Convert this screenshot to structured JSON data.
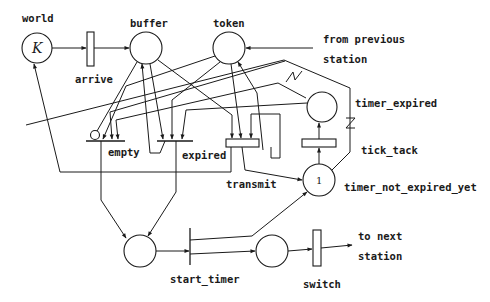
{
  "diagram": {
    "type": "petri-net",
    "places": [
      {
        "id": "world",
        "label": "world",
        "marking": "K"
      },
      {
        "id": "buffer",
        "label": "buffer",
        "marking": ""
      },
      {
        "id": "token",
        "label": "token",
        "marking": ""
      },
      {
        "id": "timer_expired",
        "label": "timer_expired",
        "marking": ""
      },
      {
        "id": "timer_not_expired_yet",
        "label": "timer_not_expired_yet",
        "marking": "1"
      },
      {
        "id": "p_start",
        "label": "",
        "marking": ""
      },
      {
        "id": "p_switch",
        "label": "",
        "marking": ""
      }
    ],
    "transitions": [
      {
        "id": "arrive",
        "label": "arrive"
      },
      {
        "id": "empty",
        "label": "empty"
      },
      {
        "id": "expired",
        "label": "expired"
      },
      {
        "id": "transmit",
        "label": "transmit"
      },
      {
        "id": "tick_tack",
        "label": "tick_tack"
      },
      {
        "id": "start_timer",
        "label": "start_timer"
      },
      {
        "id": "switch",
        "label": "switch"
      }
    ],
    "external": {
      "from_previous_line1": "from previous",
      "from_previous_line2": "station",
      "to_next_line1": "to next",
      "to_next_line2": "station"
    }
  }
}
